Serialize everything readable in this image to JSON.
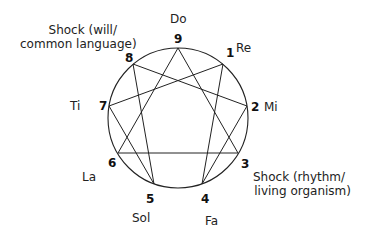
{
  "diagram": {
    "type": "enneagram",
    "points": [
      {
        "number": "9",
        "note": "Do"
      },
      {
        "number": "1",
        "note": "Re"
      },
      {
        "number": "2",
        "note": "Mi"
      },
      {
        "number": "3",
        "note": ""
      },
      {
        "number": "4",
        "note": "Fa"
      },
      {
        "number": "5",
        "note": "Sol"
      },
      {
        "number": "6",
        "note": "La"
      },
      {
        "number": "7",
        "note": "Ti"
      },
      {
        "number": "8",
        "note": ""
      }
    ],
    "shocks": {
      "upper": {
        "line1": "Shock (will/",
        "line2": "common language)"
      },
      "lower": {
        "line1": "Shock (rhythm/",
        "line2": "living organism)"
      }
    },
    "lines": {
      "triangle": [
        "9",
        "3",
        "6"
      ],
      "hexad": [
        "1",
        "4",
        "2",
        "8",
        "5",
        "7"
      ]
    },
    "colors": {
      "stroke": "#222222",
      "background": "#ffffff"
    }
  }
}
